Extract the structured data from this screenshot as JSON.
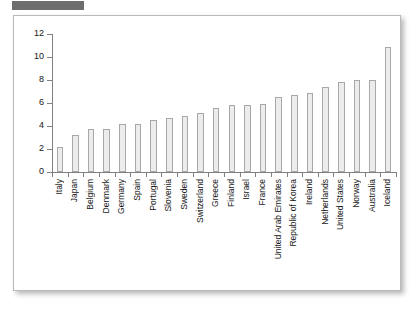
{
  "figure": {
    "redaction_label": "",
    "panel_background": "#ffffff",
    "bar_fill": "#ececec",
    "bar_stroke": "#a8a8a8",
    "axis_color": "#808080"
  },
  "chart_data": {
    "type": "bar",
    "title": "",
    "xlabel": "",
    "ylabel": "",
    "ylim": [
      0,
      12
    ],
    "yticks": [
      0,
      2,
      4,
      6,
      8,
      10,
      12
    ],
    "grid": false,
    "legend": null,
    "categories": [
      "Italy",
      "Japan",
      "Belgium",
      "Denmark",
      "Germany",
      "Spain",
      "Portugal",
      "Slovenia",
      "Sweden",
      "Switzerland",
      "Greece",
      "Finland",
      "Israel",
      "France",
      "United Arab Emirates",
      "Republic of Korea",
      "Ireland",
      "Netherlands",
      "United States",
      "Norway",
      "Australia",
      "Iceland"
    ],
    "values": [
      2.2,
      3.2,
      3.7,
      3.7,
      4.2,
      4.2,
      4.5,
      4.7,
      4.9,
      5.1,
      5.6,
      5.8,
      5.8,
      5.9,
      6.5,
      6.7,
      6.9,
      7.4,
      7.8,
      8.0,
      8.0,
      10.9
    ]
  }
}
